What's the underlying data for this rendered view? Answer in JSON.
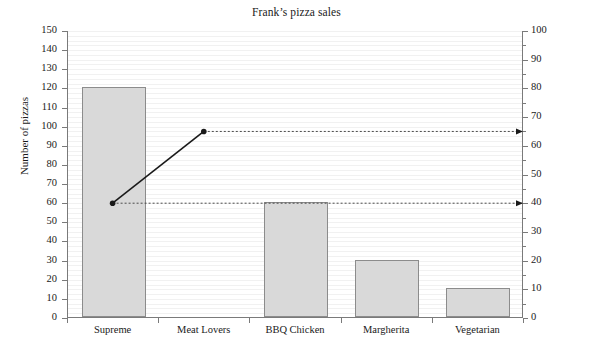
{
  "chart_data": {
    "type": "bar",
    "title": "Frank’s pizza sales",
    "categories": [
      "Supreme",
      "Meat Lovers",
      "BBQ Chicken",
      "Margherita",
      "Vegetarian"
    ],
    "values": [
      120,
      0,
      60,
      30,
      15
    ],
    "xlabel": "",
    "ylabel": "Number of pizzas",
    "ylim": [
      0,
      150
    ],
    "ytick_step": 10,
    "yticks": [
      0,
      10,
      20,
      30,
      40,
      50,
      60,
      70,
      80,
      90,
      100,
      110,
      120,
      130,
      140,
      150
    ],
    "secondary_axis": {
      "label": "Cumulative percentage",
      "ylim": [
        0,
        100
      ],
      "ytick_step": 10,
      "yticks": [
        0,
        10,
        20,
        30,
        40,
        50,
        60,
        70,
        80,
        90,
        100
      ],
      "minor_tick_step": 5
    },
    "series": [
      {
        "name": "Cumulative percentage",
        "type": "line",
        "axis": "secondary",
        "x": [
          "Supreme",
          "Meat Lovers"
        ],
        "values": [
          40,
          65
        ],
        "marker": "circle",
        "color": "#1a1a1a"
      }
    ],
    "annotations": [
      {
        "type": "dotted-arrow",
        "from_category": "Supreme",
        "to_axis": "right",
        "value": 40
      },
      {
        "type": "dotted-arrow",
        "from_category": "Meat Lovers",
        "to_axis": "right",
        "value": 65
      }
    ],
    "grid": true,
    "grid_axis": "y",
    "legend": "none",
    "bar_color": "#d9d9d9",
    "bar_edge_color": "#8c8c8c",
    "axis_color": "#7a7a7a"
  }
}
